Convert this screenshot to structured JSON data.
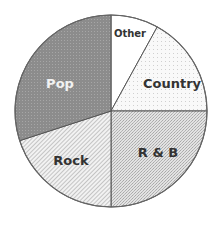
{
  "chart_data": {
    "type": "pie",
    "title": "",
    "start_angle_deg": 0,
    "direction": "clockwise",
    "center": [
      111,
      111
    ],
    "radius": 96,
    "slices": [
      {
        "label": "Other",
        "value": 8,
        "fill": "#ffffff",
        "pattern": "none",
        "text_color": "#333333",
        "label_pos": [
          130,
          37
        ],
        "font_size": 10
      },
      {
        "label": "Country",
        "value": 17,
        "fill": "#f7f7f7",
        "pattern": "sparse-dots",
        "text_color": "#333333",
        "label_pos": [
          172,
          88
        ],
        "font_size": 13
      },
      {
        "label": "R & B",
        "value": 25,
        "fill": "#d2d2d2",
        "pattern": "stipple",
        "text_color": "#333333",
        "label_pos": [
          158,
          157
        ],
        "font_size": 13
      },
      {
        "label": "Rock",
        "value": 20,
        "fill": "#ececec",
        "pattern": "hatch",
        "text_color": "#333333",
        "label_pos": [
          71,
          165
        ],
        "font_size": 13
      },
      {
        "label": "Pop",
        "value": 30,
        "fill": "#8e8e8e",
        "pattern": "dark-dots",
        "text_color": "#f2f2f2",
        "label_pos": [
          60,
          88
        ],
        "font_size": 13
      }
    ],
    "legend": "none"
  },
  "colors": {
    "outline": "#666666",
    "divider": "#555555"
  }
}
